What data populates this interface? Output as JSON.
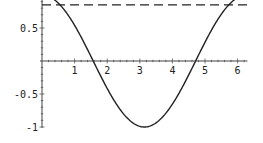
{
  "chart_data": {
    "type": "line",
    "title": "",
    "xlabel": "",
    "ylabel": "",
    "xlim": [
      0,
      6.3
    ],
    "ylim": [
      -1,
      1
    ],
    "grid": false,
    "x_ticks": [
      1,
      2,
      3,
      4,
      5,
      6
    ],
    "x_tick_labels": [
      "1",
      "2",
      "3",
      "4",
      "5",
      "6"
    ],
    "y_ticks": [
      0.5,
      -0.5,
      -1
    ],
    "y_tick_labels": [
      "0.5",
      "-0.5",
      "-1"
    ],
    "series": [
      {
        "name": "cos(x)",
        "style": "solid",
        "function": "cos",
        "x_range": [
          0,
          6.2832
        ],
        "samples": [
          [
            0,
            1
          ],
          [
            0.5,
            0.878
          ],
          [
            1,
            0.54
          ],
          [
            1.5,
            0.071
          ],
          [
            1.5708,
            0
          ],
          [
            2,
            -0.416
          ],
          [
            2.5,
            -0.801
          ],
          [
            3,
            -0.99
          ],
          [
            3.1416,
            -1
          ],
          [
            3.5,
            -0.936
          ],
          [
            4,
            -0.654
          ],
          [
            4.5,
            -0.211
          ],
          [
            4.7124,
            0
          ],
          [
            5,
            0.284
          ],
          [
            5.5,
            0.709
          ],
          [
            6,
            0.96
          ],
          [
            6.2832,
            1
          ]
        ]
      },
      {
        "name": "constant",
        "style": "dashed",
        "x": [
          0,
          6.3
        ],
        "y": [
          0.85,
          0.85
        ]
      }
    ],
    "colors": {
      "curve": "#222222",
      "axis": "#444444"
    }
  }
}
